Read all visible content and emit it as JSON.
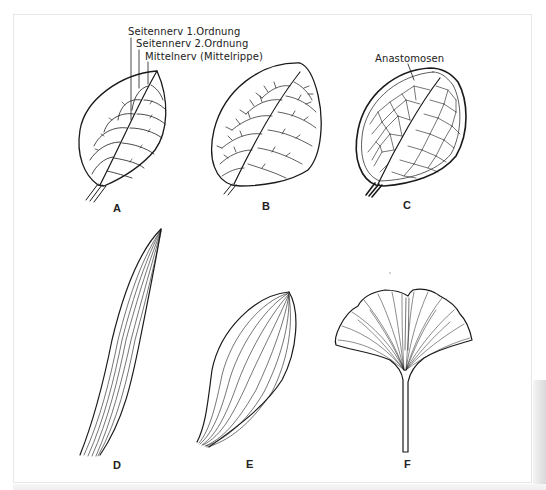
{
  "figure": {
    "annotations": {
      "lateral_vein_1": "Seitennerv 1.Ordnung",
      "lateral_vein_2": "Seitennerv  2.Ordnung",
      "midrib": "Mittelnerv (Mittelrippe)",
      "anastomoses": "Anastomosen"
    },
    "panels": [
      {
        "id": "A",
        "label": "A",
        "description": "pinnate venation, leaf with midrib and lateral veins"
      },
      {
        "id": "B",
        "label": "B",
        "description": "pinnate venation with branched reticulate veins"
      },
      {
        "id": "C",
        "label": "C",
        "description": "reticulate venation with anastomoses"
      },
      {
        "id": "D",
        "label": "D",
        "description": "parallel venation, grass-like leaf"
      },
      {
        "id": "E",
        "label": "E",
        "description": "arcuate/curved parallel venation"
      },
      {
        "id": "F",
        "label": "F",
        "description": "dichotomous venation, ginkgo leaf"
      }
    ],
    "colors": {
      "ink": "#1a1a1a",
      "background": "#ffffff",
      "frame": "#e6e6e6"
    }
  }
}
